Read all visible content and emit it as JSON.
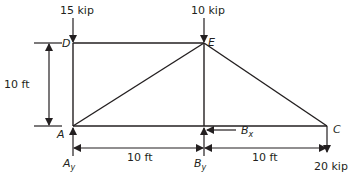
{
  "figure": {
    "type": "truss-free-body-diagram",
    "nodes": {
      "A": {
        "label": "A",
        "x_ft": 0,
        "y_ft": 0
      },
      "B": {
        "label": "B",
        "x_ft": 10,
        "y_ft": 0
      },
      "C": {
        "label": "C",
        "x_ft": 20,
        "y_ft": 0
      },
      "D": {
        "label": "D",
        "x_ft": 0,
        "y_ft": 10
      },
      "E": {
        "label": "E",
        "x_ft": 10,
        "y_ft": 10
      }
    },
    "members": [
      [
        "A",
        "D"
      ],
      [
        "D",
        "E"
      ],
      [
        "A",
        "E"
      ],
      [
        "A",
        "B"
      ],
      [
        "B",
        "E"
      ],
      [
        "B",
        "C"
      ],
      [
        "E",
        "C"
      ]
    ],
    "loads": [
      {
        "node": "D",
        "label": "15 kip",
        "direction": "down"
      },
      {
        "node": "E",
        "label": "10 kip",
        "direction": "down"
      },
      {
        "node": "C",
        "label": "20 kip",
        "direction": "down"
      }
    ],
    "reactions": [
      {
        "node": "A",
        "label": "A",
        "sub": "y",
        "direction": "up"
      },
      {
        "node": "B",
        "label": "B",
        "sub": "y",
        "direction": "up"
      },
      {
        "node": "B",
        "label": "B",
        "sub": "x",
        "direction": "left"
      }
    ],
    "dimensions": {
      "height": "10 ft",
      "span_AB": "10 ft",
      "span_BC": "10 ft"
    }
  }
}
